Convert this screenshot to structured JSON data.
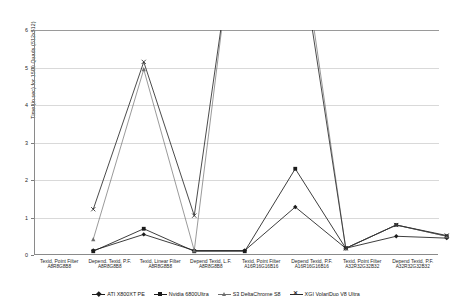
{
  "chart_data": {
    "type": "line",
    "title": "",
    "subtitle": "",
    "xlabel": "",
    "ylabel": "Time (in sec) for 1500 Quads (512x512)",
    "ylim": [
      0,
      6
    ],
    "yticks": [
      0,
      1,
      2,
      3,
      4,
      5,
      6
    ],
    "grid": true,
    "legend_position": "bottom",
    "clipped_note": "S3 DeltaChrome S8 and XGI VolariDuo V8 Ultra exceed the 6 sec axis maximum at the A16R16G16B16 and A32R32G32B32 categories",
    "categories": [
      "Texid, Point Filter A8R8G8B8",
      "Depend. Texid, P.F. A8R8G8B8",
      "Texid, Linear Filter A8R8G8B8",
      "Depend Texid, L.F. A8R8G8B8",
      "Texid, Point Filter A16R16G16B16",
      "Depend Texid, P.F. A16R16G16B16",
      "Texid, Point Filter A32R32G32B32",
      "Depend Texid, P.F. A32R32G32B32"
    ],
    "category_labels": [
      {
        "line1": "Texid, Point Filter",
        "line2": "A8R8G8B8"
      },
      {
        "line1": "Depend. Texid, P.F.",
        "line2": "A8R8G8B8"
      },
      {
        "line1": "Texid, Linear Filter",
        "line2": "A8R8G8B8"
      },
      {
        "line1": "Depend Texid, L.F.",
        "line2": "A8R8G8B8"
      },
      {
        "line1": "Texid, Point Filter",
        "line2": "A16R16G16B16"
      },
      {
        "line1": "Depend Texid, P.F.",
        "line2": "A16R16G16B16"
      },
      {
        "line1": "Texid, Point Filter",
        "line2": "A32R32G32B32"
      },
      {
        "line1": "Depend Texid, P.F.",
        "line2": "A32R32G32B32"
      }
    ],
    "series": [
      {
        "name": "ATI X800XT PE",
        "marker": "diamond",
        "color": "#1b1b1b",
        "values": [
          0.12,
          0.55,
          0.12,
          0.12,
          1.28,
          0.18,
          0.5,
          0.45
        ]
      },
      {
        "name": "Nvidia 6800Ultra",
        "marker": "square",
        "color": "#1b1b1b",
        "values": [
          0.1,
          0.7,
          0.1,
          0.1,
          2.3,
          0.18,
          0.8,
          0.5
        ]
      },
      {
        "name": "S3 DeltaChrome S8",
        "marker": "triangle",
        "color": "#6e6e6e",
        "values": [
          0.42,
          4.95,
          0.12,
          11.0,
          9.5,
          0.18,
          0.8,
          0.5
        ]
      },
      {
        "name": "XGI VolariDuo V8 Ultra",
        "marker": "x",
        "color": "#2b2b2b",
        "values": [
          1.22,
          5.15,
          1.05,
          10.5,
          9.0,
          0.18,
          0.8,
          0.52
        ]
      }
    ]
  },
  "legend": {
    "items": [
      {
        "label": "ATI X800XT PE"
      },
      {
        "label": "Nvidia 6800Ultra"
      },
      {
        "label": "S3 DeltaChrome S8"
      },
      {
        "label": "XGI VolariDuo V8 Ultra"
      }
    ]
  },
  "axis": {
    "ylabels": [
      "6",
      "5",
      "4",
      "3",
      "2",
      "1",
      "0"
    ]
  }
}
